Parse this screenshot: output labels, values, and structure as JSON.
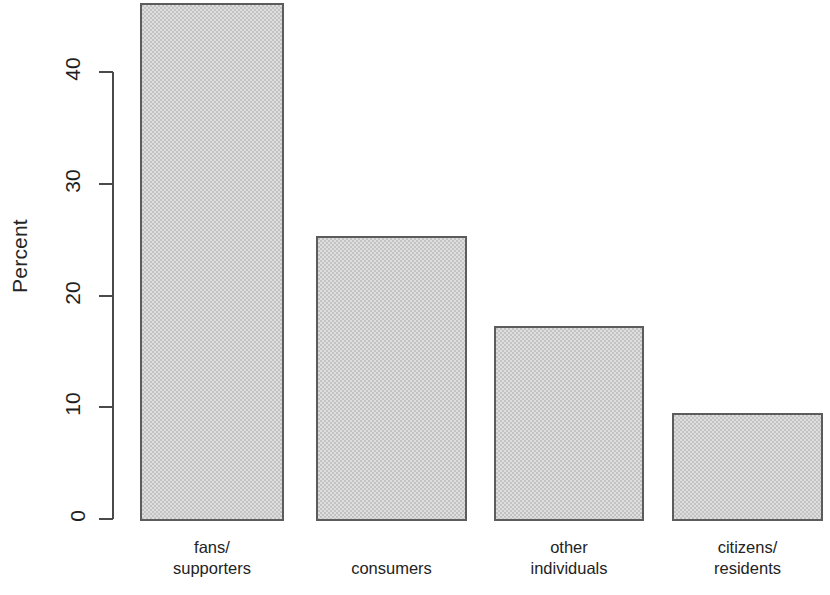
{
  "chart_data": {
    "type": "bar",
    "title": "",
    "subtitle": "",
    "xlabel": "",
    "ylabel": "Percent",
    "categories": [
      "fans/\nsupporters",
      "consumers",
      "other\nindividuals",
      "citizens/\nresidents"
    ],
    "values": [
      46.2,
      25.3,
      17.3,
      9.5
    ],
    "ylim": [
      0,
      46.2
    ],
    "yticks": [
      0,
      10,
      20,
      30,
      40
    ],
    "ytick_labels": [
      "0",
      "10",
      "20",
      "30",
      "40"
    ],
    "grid": false,
    "legend": null,
    "bar_fill_color": "#c3c3c3",
    "bar_border_color": "#5c5c5c",
    "axis_color": "#4a4a4a",
    "background_color": "#ffffff"
  },
  "axis": {
    "y_title": "Percent"
  }
}
